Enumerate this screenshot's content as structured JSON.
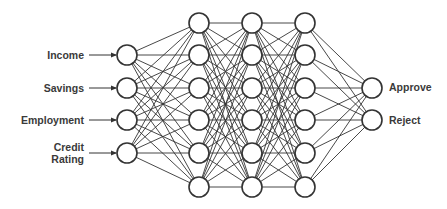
{
  "diagram": {
    "stroke_color": "#333333",
    "node_fill": "#ffffff",
    "node_radius": 10,
    "layers": [
      {
        "name": "input",
        "x": 127,
        "ys": [
          55,
          88,
          120,
          153
        ]
      },
      {
        "name": "hidden-1",
        "x": 199,
        "ys": [
          23,
          55,
          88,
          120,
          153,
          187
        ]
      },
      {
        "name": "hidden-2",
        "x": 252,
        "ys": [
          23,
          55,
          88,
          120,
          153,
          187
        ]
      },
      {
        "name": "hidden-3",
        "x": 305,
        "ys": [
          23,
          55,
          88,
          120,
          153,
          187
        ]
      },
      {
        "name": "output",
        "x": 372,
        "ys": [
          88,
          120
        ]
      }
    ],
    "inputs": [
      {
        "label": "Income",
        "y": 55
      },
      {
        "label": "Savings",
        "y": 88
      },
      {
        "label": "Employment",
        "y": 120
      },
      {
        "label": "Credit\nRating",
        "line1": "Credit",
        "line2": "Rating",
        "y": 153
      }
    ],
    "outputs": [
      {
        "label": "Approve",
        "y": 88
      },
      {
        "label": "Reject",
        "y": 120
      }
    ]
  }
}
